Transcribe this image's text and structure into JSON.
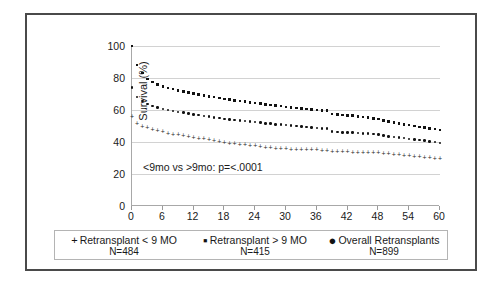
{
  "chart_data": {
    "type": "line",
    "title": "",
    "xlabel": "Months Post Transplantation",
    "ylabel": "Survival (%)",
    "xlim": [
      0,
      60
    ],
    "ylim": [
      0,
      100
    ],
    "xticks": [
      0,
      6,
      12,
      18,
      24,
      30,
      36,
      42,
      48,
      54,
      60
    ],
    "yticks": [
      0,
      20,
      40,
      60,
      80,
      100
    ],
    "grid": "horizontal",
    "legend_position": "below",
    "annotations": [
      "<9mo vs >9mo: p=<.0001"
    ],
    "marker_color": "#121212",
    "series": [
      {
        "name": "Retransplant < 9 MO",
        "n": "N=484",
        "marker": "plus",
        "x": [
          0,
          1,
          2,
          3,
          4,
          5,
          6,
          7,
          8,
          9,
          10,
          11,
          12,
          13,
          14,
          15,
          16,
          17,
          18,
          19,
          20,
          21,
          22,
          23,
          24,
          25,
          26,
          27,
          28,
          29,
          30,
          31,
          32,
          33,
          34,
          35,
          36,
          37,
          38,
          39,
          40,
          41,
          42,
          43,
          44,
          45,
          46,
          47,
          48,
          49,
          50,
          51,
          52,
          53,
          54,
          55,
          56,
          57,
          58,
          59,
          60
        ],
        "values": [
          56.0,
          51.5,
          50.0,
          48.8,
          47.8,
          47.0,
          46.3,
          45.6,
          45.0,
          44.5,
          44.0,
          43.5,
          43.0,
          42.5,
          42.0,
          41.4,
          40.8,
          40.2,
          39.6,
          39.2,
          38.9,
          38.6,
          38.3,
          38.0,
          37.7,
          37.2,
          36.8,
          36.5,
          36.2,
          36.0,
          35.8,
          35.6,
          35.5,
          35.4,
          35.3,
          35.2,
          35.1,
          34.8,
          34.5,
          34.3,
          34.1,
          33.9,
          33.8,
          33.7,
          33.6,
          33.5,
          33.4,
          33.3,
          33.2,
          33.0,
          32.6,
          32.3,
          32.0,
          31.7,
          31.4,
          31.1,
          30.8,
          30.5,
          30.2,
          29.9,
          29.5
        ]
      },
      {
        "name": "Retransplant > 9 MO",
        "n": "N=415",
        "marker": "square",
        "x": [
          0,
          1,
          2,
          3,
          4,
          5,
          6,
          7,
          8,
          9,
          10,
          11,
          12,
          13,
          14,
          15,
          16,
          17,
          18,
          19,
          20,
          21,
          22,
          23,
          24,
          25,
          26,
          27,
          28,
          29,
          30,
          31,
          32,
          33,
          34,
          35,
          36,
          37,
          38,
          39,
          40,
          41,
          42,
          43,
          44,
          45,
          46,
          47,
          48,
          49,
          50,
          51,
          52,
          53,
          54,
          55,
          56,
          57,
          58,
          59,
          60
        ],
        "values": [
          100.0,
          88.0,
          83.0,
          79.5,
          77.5,
          76.0,
          74.8,
          73.8,
          73.0,
          72.3,
          71.6,
          71.0,
          70.4,
          69.8,
          69.2,
          68.6,
          68.0,
          67.5,
          67.0,
          66.5,
          66.0,
          65.6,
          65.2,
          64.8,
          64.4,
          64.0,
          63.6,
          63.2,
          62.8,
          62.4,
          62.0,
          61.6,
          61.2,
          60.8,
          60.5,
          60.2,
          60.0,
          59.8,
          59.6,
          57.5,
          57.2,
          57.0,
          56.7,
          56.4,
          56.0,
          55.6,
          55.2,
          54.8,
          54.3,
          53.6,
          52.8,
          52.2,
          51.6,
          51.0,
          50.5,
          50.0,
          49.5,
          49.0,
          48.5,
          48.0,
          47.4
        ]
      },
      {
        "name": "Overall Retransplants",
        "n": "N=899",
        "marker": "dot",
        "x": [
          0,
          1,
          2,
          3,
          4,
          5,
          6,
          7,
          8,
          9,
          10,
          11,
          12,
          13,
          14,
          15,
          16,
          17,
          18,
          19,
          20,
          21,
          22,
          23,
          24,
          25,
          26,
          27,
          28,
          29,
          30,
          31,
          32,
          33,
          34,
          35,
          36,
          37,
          38,
          39,
          40,
          41,
          42,
          43,
          44,
          45,
          46,
          47,
          48,
          49,
          50,
          51,
          52,
          53,
          54,
          55,
          56,
          57,
          58,
          59,
          60
        ],
        "values": [
          74.0,
          68.0,
          65.5,
          63.8,
          62.5,
          61.5,
          60.7,
          60.0,
          59.4,
          58.8,
          58.3,
          57.8,
          57.3,
          56.8,
          56.3,
          55.8,
          55.3,
          54.9,
          54.5,
          54.1,
          53.7,
          53.4,
          53.1,
          52.8,
          52.5,
          52.1,
          51.7,
          51.4,
          51.1,
          50.8,
          50.5,
          50.2,
          49.9,
          49.6,
          49.3,
          49.0,
          48.8,
          48.6,
          48.4,
          46.6,
          46.3,
          46.1,
          46.0,
          45.8,
          45.6,
          45.4,
          45.2,
          45.0,
          44.7,
          44.2,
          43.6,
          43.2,
          42.8,
          42.4,
          42.0,
          41.6,
          41.2,
          40.8,
          40.4,
          40.0,
          39.4
        ]
      }
    ]
  },
  "legend": {
    "entries": [
      {
        "marker": "+",
        "label": "Retransplant < 9 MO",
        "n": "N=484"
      },
      {
        "marker": "▪",
        "label": "Retransplant > 9 MO",
        "n": "N=415"
      },
      {
        "marker": "●",
        "label": "Overall Retransplants",
        "n": "N=899"
      }
    ]
  }
}
